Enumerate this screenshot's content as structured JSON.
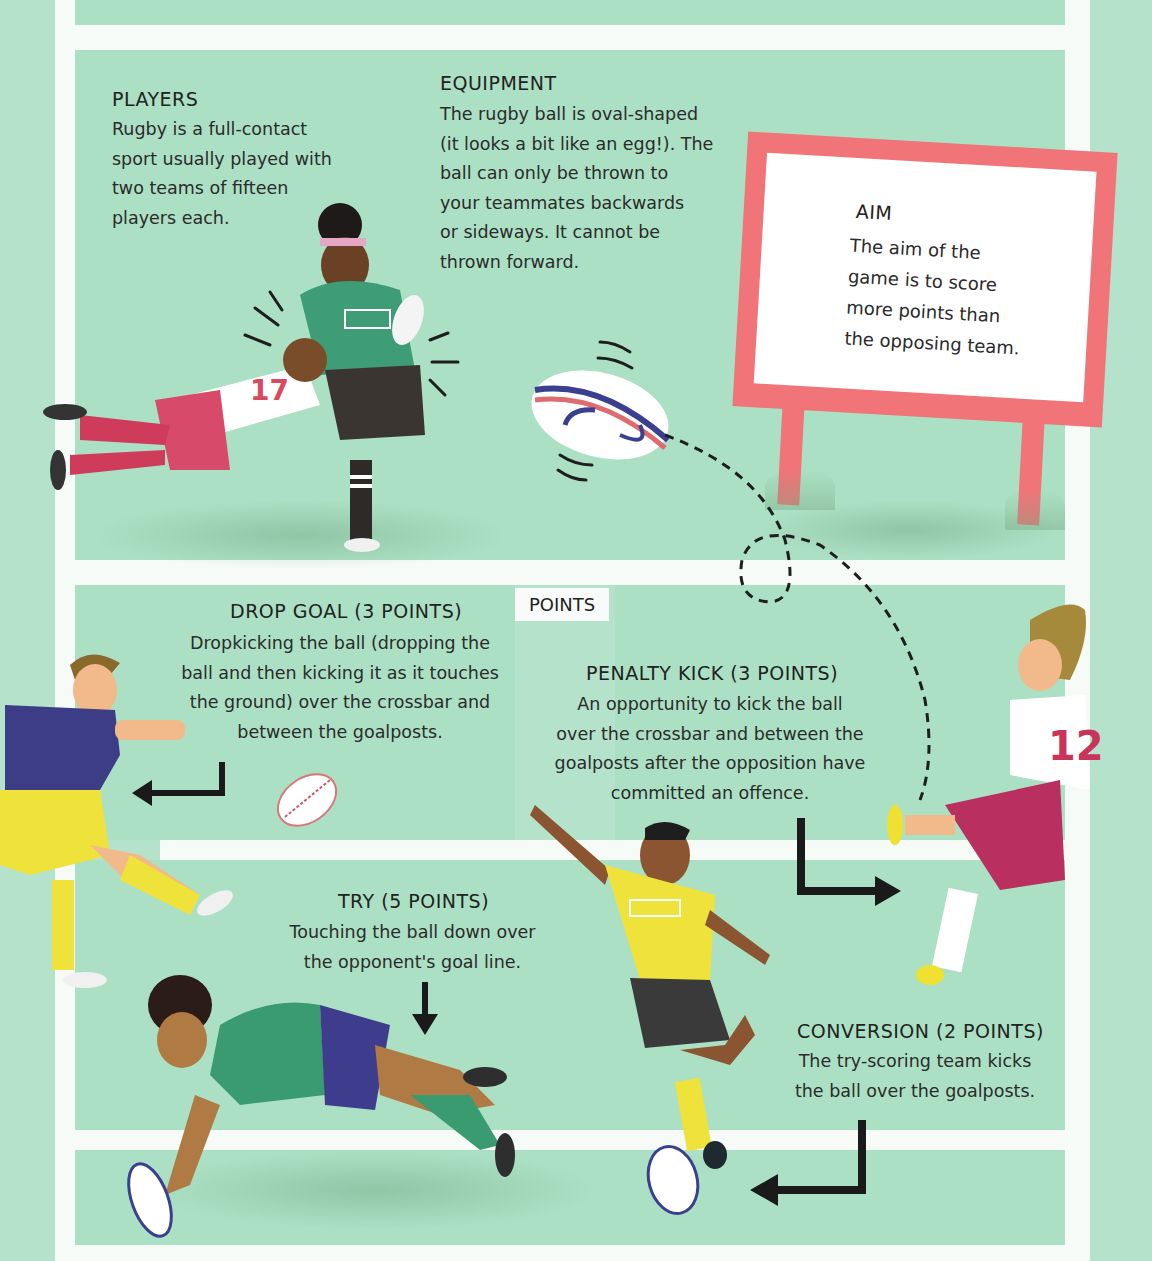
{
  "colors": {
    "background": "#b4e2cb",
    "panel": "#ace0c4",
    "field_lines": "#f7fbf8",
    "sign_frame": "#f07478",
    "text": "#2b2b2b",
    "ball_navy": "#3a3f8f",
    "ball_red": "#e06a6e"
  },
  "top_strip": {
    "partial_text": "…"
  },
  "sections": {
    "players": {
      "heading": "PLAYERS",
      "lines": [
        "Rugby is a full-contact",
        "sport usually played with",
        "two teams of fifteen",
        "players each."
      ]
    },
    "equipment": {
      "heading": "EQUIPMENT",
      "lines": [
        "The rugby ball is oval-shaped",
        "(it looks a bit like an egg!). The",
        "ball can only be thrown to",
        "your teammates backwards",
        "or sideways. It cannot be",
        "thrown forward."
      ]
    },
    "aim": {
      "heading": "AIM",
      "lines": [
        "The aim of the",
        "game is to score",
        "more points than",
        "the opposing team."
      ]
    },
    "points_tag": "POINTS",
    "drop_goal": {
      "heading": "DROP GOAL (3 POINTS)",
      "lines": [
        "Dropkicking the ball (dropping the",
        "ball and then kicking it as it touches",
        "the ground) over the crossbar and",
        "between the goalposts."
      ]
    },
    "penalty_kick": {
      "heading": "PENALTY KICK (3 POINTS)",
      "lines": [
        "An opportunity to kick the ball",
        "over the crossbar and between the",
        "goalposts after the opposition have",
        "committed an offence."
      ]
    },
    "try": {
      "heading": "TRY (5 POINTS)",
      "lines": [
        "Touching the ball down over",
        "the opponent's goal line."
      ]
    },
    "conversion": {
      "heading": "CONVERSION (2 POINTS)",
      "lines": [
        "The try-scoring team kicks",
        "the ball over the goalposts."
      ]
    }
  },
  "illustrations": {
    "tackle_jersey_number": "17",
    "penalty_kicker_jersey_number": "12"
  }
}
